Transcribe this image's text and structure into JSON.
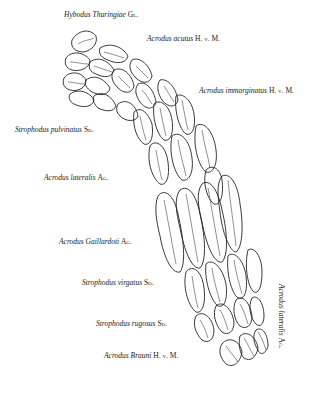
{
  "figure": {
    "labels": [
      {
        "genus_species": "Hybodus Thuringiae",
        "author": "Gl.",
        "x": 64,
        "y": 15
      },
      {
        "genus_species": "Acrodus acutus",
        "author": "H. v. M.",
        "x": 147,
        "y": 38
      },
      {
        "genus_species": "Acrodus immarginatus",
        "author": "H. v. M.",
        "x": 199,
        "y": 90
      },
      {
        "genus_species": "Strophodus pulvinatus",
        "author": "Sd.",
        "x": 15,
        "y": 129
      },
      {
        "genus_species": "Acrodus lateralis",
        "author": "Ag.",
        "x": 44,
        "y": 177
      },
      {
        "genus_species": "Acrodus Gaillardoti",
        "author": "Ag.",
        "x": 59,
        "y": 239
      },
      {
        "genus_species": "Strophodus virgatus",
        "author": "Sd.",
        "x": 82,
        "y": 281
      },
      {
        "genus_species": "Strophodus rugosus",
        "author": "Sd.",
        "x": 96,
        "y": 321
      },
      {
        "genus_species": "Acrodus Brauni",
        "author": "H. v. M.",
        "x": 104,
        "y": 353
      }
    ],
    "vertical_label": {
      "genus_species": "Acrodus lateralis",
      "author": "Ag.",
      "x": 286,
      "y": 284
    }
  }
}
